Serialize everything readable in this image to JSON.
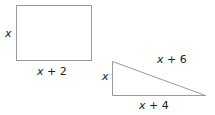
{
  "rectangle": {
    "height_label": "x",
    "width_label": "x + 2",
    "width_var": "x",
    "width_rest": " + 2"
  },
  "triangle": {
    "height_label": "x",
    "base_label": "x + 4",
    "base_var": "x",
    "base_rest": " + 4",
    "hypotenuse_label": "x + 6",
    "hyp_var": "x",
    "hyp_rest": " + 6"
  },
  "colors": {
    "stroke": "#9a9a9a",
    "text": "#222222"
  }
}
